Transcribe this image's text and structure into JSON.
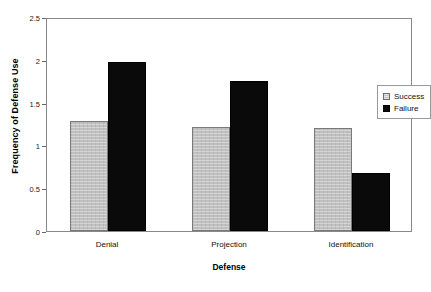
{
  "chart_data": {
    "type": "bar",
    "title": "",
    "xlabel": "Defense",
    "ylabel": "Frequency of Defense Use",
    "categories": [
      "Denial",
      "Projection",
      "Identification"
    ],
    "series": [
      {
        "name": "Success",
        "color": "#c0c0c0",
        "values": [
          1.28,
          1.21,
          1.2
        ]
      },
      {
        "name": "Failure",
        "color": "#0a0a0a",
        "values": [
          1.97,
          1.75,
          0.68
        ]
      }
    ],
    "ylim": [
      0,
      2.5
    ],
    "yticks": [
      "0",
      "0.5",
      "1",
      "1.5",
      "2",
      "2.5"
    ],
    "ytick_values": [
      0,
      0.5,
      1,
      1.5,
      2,
      2.5
    ],
    "grid": false,
    "legend_position": "upper right"
  }
}
